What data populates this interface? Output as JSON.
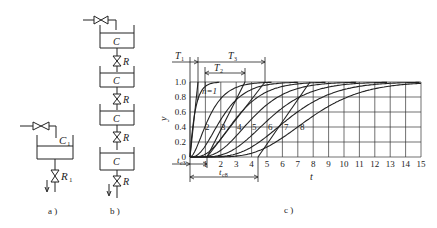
{
  "panels": {
    "a": {
      "caption": "a )",
      "tank_label": "C",
      "tank_sub": "1",
      "valve_label": "R",
      "valve_sub": "1"
    },
    "b": {
      "caption": "b )",
      "tank_label": "C",
      "valve_label": "R",
      "tank_count": 4
    },
    "c": {
      "caption": "c )"
    }
  },
  "chart_data": {
    "type": "line",
    "title": "",
    "xlabel": "t",
    "ylabel": "y",
    "xlim": [
      0,
      15
    ],
    "ylim": [
      0,
      1.0
    ],
    "x_ticks": [
      "0",
      "1",
      "2",
      "3",
      "4",
      "5",
      "6",
      "7",
      "8",
      "9",
      "10",
      "11",
      "12",
      "13",
      "14",
      "15"
    ],
    "y_ticks": [
      "0",
      "0.2",
      "0.4",
      "0.6",
      "0.8",
      "1.0"
    ],
    "grid": true,
    "series_labels": [
      "n=1",
      "2",
      "3",
      "4",
      "5",
      "6",
      "7",
      "8"
    ],
    "series": [
      {
        "name": "n=1",
        "description": "first-order step response"
      },
      {
        "name": "2"
      },
      {
        "name": "3"
      },
      {
        "name": "4"
      },
      {
        "name": "5"
      },
      {
        "name": "6"
      },
      {
        "name": "7"
      },
      {
        "name": "8"
      }
    ],
    "annotations": {
      "T1": "T",
      "T1_sub": "1",
      "T2": "T",
      "T2_sub": "2",
      "T3": "T",
      "T3_sub": "3",
      "tc3": "t",
      "tc3_sub": "c3",
      "tc8": "t",
      "tc8_sub": "c8"
    }
  }
}
